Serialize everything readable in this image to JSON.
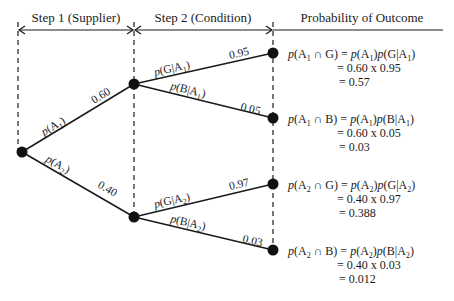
{
  "header": {
    "step1": "Step 1 (Supplier)",
    "step2": "Step 2 (Condition)",
    "outcome": "Probability of Outcome"
  },
  "colors": {
    "ink": "#1a1a1a",
    "background": "#ffffff"
  },
  "branches": {
    "a1": {
      "label_p": "p",
      "label_arg": "A",
      "label_sub": "1",
      "value": "0.60"
    },
    "a2": {
      "label_p": "p",
      "label_arg": "A",
      "label_sub": "2",
      "value": "0.40"
    },
    "g_a1": {
      "label_p": "p",
      "label_arg": "G",
      "label_given": "A",
      "label_sub": "1",
      "value": "0.95"
    },
    "b_a1": {
      "label_p": "p",
      "label_arg": "B",
      "label_given": "A",
      "label_sub": "1",
      "value": "0.05"
    },
    "g_a2": {
      "label_p": "p",
      "label_arg": "G",
      "label_given": "A",
      "label_sub": "2",
      "value": "0.97"
    },
    "b_a2": {
      "label_p": "p",
      "label_arg": "B",
      "label_given": "A",
      "label_sub": "2",
      "value": "0.03"
    }
  },
  "outcomes": [
    {
      "sub": "1",
      "event": "G",
      "line2": "= 0.60 x 0.95",
      "line3": "= 0.57"
    },
    {
      "sub": "1",
      "event": "B",
      "line2": "= 0.60 x 0.05",
      "line3": "= 0.03"
    },
    {
      "sub": "2",
      "event": "G",
      "line2": "= 0.40 x 0.97",
      "line3": "= 0.388"
    },
    {
      "sub": "2",
      "event": "B",
      "line2": "= 0.40 x 0.03",
      "line3": "= 0.012"
    }
  ],
  "symbols": {
    "p": "p",
    "A": "A",
    "cap": " ∩ ",
    "eq": " = ",
    "lp": "(",
    "rp": ")",
    "bar": "|"
  }
}
